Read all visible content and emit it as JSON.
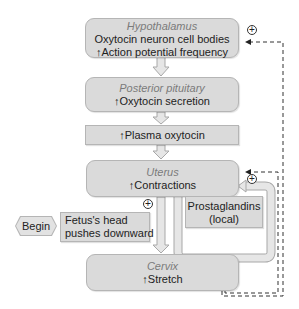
{
  "diagram": {
    "nodes": {
      "hypothalamus": {
        "title": "Hypothalamus",
        "line1": "Oxytocin neuron cell bodies",
        "line2": "↑Action potential frequency"
      },
      "posterior_pituitary": {
        "title": "Posterior pituitary",
        "line1": "↑Oxytocin secretion"
      },
      "plasma": {
        "line1": "↑Plasma oxytocin"
      },
      "uterus": {
        "title": "Uterus",
        "line1": "↑Contractions"
      },
      "prostaglandins": {
        "line1": "Prostaglandins",
        "line2": "(local)"
      },
      "begin": {
        "label": "Begin"
      },
      "fetus": {
        "line1": "Fetus's head",
        "line2": "pushes downward"
      },
      "cervix": {
        "title": "Cervix",
        "line1": "↑Stretch"
      }
    },
    "feedback_symbols": {
      "hypothalamus_plus": "+",
      "uterus_plus": "+",
      "fetus_plus": "+"
    },
    "colors": {
      "box_fill": "#dadada",
      "box_border": "#b5b5b5",
      "title_text": "#7a7a7a",
      "body_text": "#222222",
      "dashed_line": "#333333"
    }
  }
}
